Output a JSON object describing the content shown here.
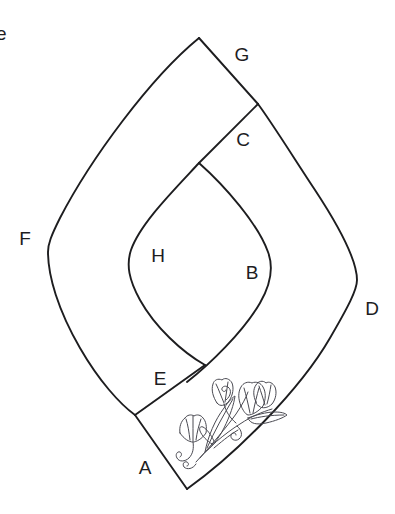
{
  "figure": {
    "background_color": "#ffffff",
    "line_color": "#1d1d1f",
    "ornament_color": "#4a4a52",
    "clipped_text": {
      "value": "e",
      "x": 8,
      "y": 34,
      "note": "partially cropped character at left edge"
    },
    "labels": [
      {
        "id": "G",
        "text": "G",
        "x": 242,
        "y": 54
      },
      {
        "id": "C",
        "text": "C",
        "x": 243,
        "y": 139
      },
      {
        "id": "D",
        "text": "D",
        "x": 372,
        "y": 308
      },
      {
        "id": "B",
        "text": "B",
        "x": 252,
        "y": 272
      },
      {
        "id": "H",
        "text": "H",
        "x": 158,
        "y": 255
      },
      {
        "id": "F",
        "text": "F",
        "x": 25,
        "y": 238
      },
      {
        "id": "E",
        "text": "E",
        "x": 160,
        "y": 378
      },
      {
        "id": "A",
        "text": "A",
        "x": 145,
        "y": 467
      }
    ],
    "vertices": {
      "G": {
        "x": 199,
        "y": 38
      },
      "C_corner": {
        "x": 258,
        "y": 104
      },
      "inner_top": {
        "x": 199,
        "y": 163
      },
      "inner_bottom": {
        "x": 205,
        "y": 365
      },
      "A_corner": {
        "x": 135,
        "y": 415
      },
      "bottom_tip": {
        "x": 187,
        "y": 489
      },
      "F_left": {
        "x": 48,
        "y": 247
      },
      "D_right": {
        "x": 357,
        "y": 299
      }
    },
    "ornament": {
      "name": "floral-sprig",
      "description": "tulip sprig with leaves and spiral tendrils",
      "region_x": 175,
      "region_y": 388,
      "region_width": 105,
      "region_height": 90
    }
  }
}
